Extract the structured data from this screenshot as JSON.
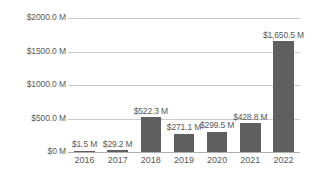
{
  "chart_data": {
    "type": "bar",
    "title": "",
    "subtitle": "",
    "xlabel": "",
    "ylabel": "",
    "categories": [
      "2016",
      "2017",
      "2018",
      "2019",
      "2020",
      "2021",
      "2022"
    ],
    "values": [
      1.5,
      29.2,
      522.3,
      271.1,
      299.5,
      428.8,
      1650.5
    ],
    "value_labels": [
      "$1.5 M",
      "$29.2 M",
      "$522.3 M",
      "$271.1 M",
      "$299.5 M",
      "$428.8 M",
      "$1,650.5 M"
    ],
    "ylim": [
      0,
      2000
    ],
    "yticks": [
      0,
      500,
      1000,
      1500,
      2000
    ],
    "ytick_labels": [
      "$0 M",
      "$500.0 M",
      "$1000.0 M",
      "$1500.0 M",
      "$2000.0 M"
    ],
    "grid": true,
    "legend": false,
    "legend_position": "none",
    "series": [
      {
        "name": "",
        "values": [
          1.5,
          29.2,
          522.3,
          271.1,
          299.5,
          428.8,
          1650.5
        ]
      }
    ],
    "colors": {
      "bar": "#5f5f5f",
      "gridline": "#cccccc",
      "baseline": "#b0b0b0",
      "text": "#595959",
      "background": "#ffffff"
    }
  }
}
